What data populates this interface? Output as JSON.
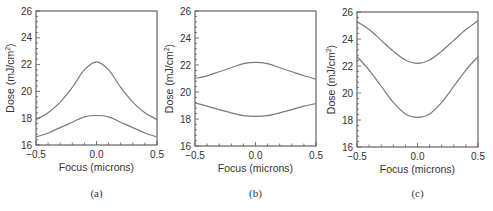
{
  "chart_data": [
    {
      "type": "line",
      "panel": "(a)",
      "xlabel": "Focus (microns)",
      "ylabel": "Dose (mJ/cm2)",
      "xlim": [
        -0.5,
        0.5
      ],
      "ylim": [
        16,
        26
      ],
      "xticks": [
        "-0.5",
        "0.0",
        "0.5"
      ],
      "yticks": [
        "16",
        "18",
        "20",
        "22",
        "24",
        "26"
      ],
      "grid": false,
      "legend": null,
      "x": [
        -0.5,
        -0.4,
        -0.3,
        -0.2,
        -0.1,
        0.0,
        0.1,
        0.2,
        0.3,
        0.4,
        0.5
      ],
      "series": [
        {
          "name": "upper",
          "values": [
            17.9,
            18.4,
            19.2,
            20.3,
            21.6,
            22.2,
            21.6,
            20.3,
            19.2,
            18.4,
            17.9
          ]
        },
        {
          "name": "lower",
          "values": [
            16.6,
            16.9,
            17.3,
            17.7,
            18.1,
            18.2,
            18.1,
            17.7,
            17.3,
            16.9,
            16.6
          ]
        }
      ]
    },
    {
      "type": "line",
      "panel": "(b)",
      "xlabel": "Focus (microns)",
      "ylabel": "Dose (mJ/cm2)",
      "xlim": [
        -0.5,
        0.5
      ],
      "ylim": [
        16,
        26
      ],
      "xticks": [
        "-0.5",
        "0.0",
        "0.5"
      ],
      "yticks": [
        "16",
        "18",
        "20",
        "22",
        "24",
        "26"
      ],
      "grid": false,
      "legend": null,
      "x": [
        -0.5,
        -0.4,
        -0.3,
        -0.2,
        -0.1,
        0.0,
        0.1,
        0.2,
        0.3,
        0.4,
        0.5
      ],
      "series": [
        {
          "name": "upper",
          "values": [
            21.0,
            21.2,
            21.5,
            21.8,
            22.1,
            22.2,
            22.1,
            21.8,
            21.5,
            21.2,
            20.95
          ]
        },
        {
          "name": "lower",
          "values": [
            19.2,
            18.95,
            18.7,
            18.45,
            18.25,
            18.2,
            18.25,
            18.45,
            18.7,
            18.95,
            19.15
          ]
        }
      ]
    },
    {
      "type": "line",
      "panel": "(c)",
      "xlabel": "Focus (microns)",
      "ylabel": "Dose (mJ/cm2)",
      "xlim": [
        -0.5,
        0.5
      ],
      "ylim": [
        16,
        26
      ],
      "xticks": [
        "-0.5",
        "0.0",
        "0.5"
      ],
      "yticks": [
        "16",
        "18",
        "20",
        "22",
        "24",
        "26"
      ],
      "grid": false,
      "legend": null,
      "x": [
        -0.5,
        -0.4,
        -0.3,
        -0.2,
        -0.1,
        0.0,
        0.1,
        0.2,
        0.3,
        0.4,
        0.5
      ],
      "series": [
        {
          "name": "upper",
          "values": [
            25.3,
            24.7,
            23.9,
            23.1,
            22.45,
            22.2,
            22.45,
            23.1,
            23.9,
            24.7,
            25.35
          ]
        },
        {
          "name": "lower",
          "values": [
            22.7,
            21.7,
            20.5,
            19.3,
            18.45,
            18.2,
            18.45,
            19.3,
            20.5,
            21.7,
            22.7
          ]
        }
      ]
    }
  ],
  "panels": [
    {
      "caption": "(a)",
      "xlabel": "Focus (microns)",
      "ylabel_main": "Dose (mJ/cm",
      "ylabel_sup": "2",
      "ylabel_end": ")"
    },
    {
      "caption": "(b)",
      "xlabel": "Focus (microns)",
      "ylabel_main": "Dose (mJ/cm",
      "ylabel_sup": "2",
      "ylabel_end": ")"
    },
    {
      "caption": "(c)",
      "xlabel": "Focus (microns)",
      "ylabel_main": "Dose (mJ/cm",
      "ylabel_sup": "2",
      "ylabel_end": ")"
    }
  ],
  "style": {
    "line_color": "#7a7a7a",
    "axis_color": "#555555",
    "text_color": "#333333"
  }
}
